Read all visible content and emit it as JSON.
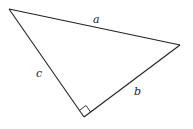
{
  "diagram": {
    "type": "right-triangle",
    "vertices": [
      {
        "id": "top-left",
        "x": 9,
        "y": 9
      },
      {
        "id": "right",
        "x": 180,
        "y": 45
      },
      {
        "id": "bottom",
        "x": 84,
        "y": 117
      }
    ],
    "right_angle_vertex": "bottom",
    "sides": {
      "a": {
        "label": "a",
        "from": "top-left",
        "to": "right",
        "label_x": 95,
        "label_y": 23
      },
      "b": {
        "label": "b",
        "from": "bottom",
        "to": "right",
        "label_x": 136,
        "label_y": 94
      },
      "c": {
        "label": "c",
        "from": "top-left",
        "to": "bottom",
        "label_x": 37,
        "label_y": 76
      }
    },
    "line_color": "#222222"
  }
}
